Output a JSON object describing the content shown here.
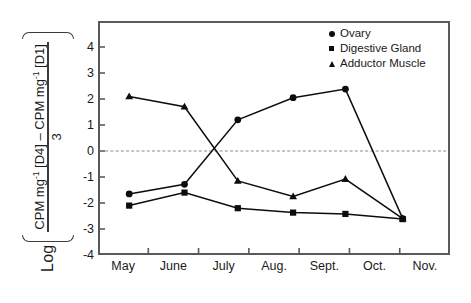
{
  "chart_data": {
    "type": "line",
    "title": "",
    "xlabel": "",
    "ylabel": "Log [ (CPM mg-1 [D4] - CPM mg-1 [D1]) / 3 ]",
    "ylabel_parts": {
      "log": "Log",
      "numerator_prefix": "CPM mg",
      "numerator_sup1": "-1",
      "numerator_mid": " [D4] – CPM mg",
      "numerator_sup2": "-1",
      "numerator_suffix": " [D1]",
      "denominator": "3"
    },
    "x_tick_labels": [
      "May",
      "June",
      "July",
      "Aug.",
      "Sept.",
      "Oct.",
      "Nov."
    ],
    "y_tick_labels": [
      "4",
      "3",
      "2",
      "1",
      "0",
      "-1",
      "-2",
      "-3",
      "-4"
    ],
    "ylim": [
      -4,
      5
    ],
    "xlim": [
      0,
      7
    ],
    "grid": false,
    "zero_reference_line": true,
    "legend_position": "top-right",
    "x": [
      0.62,
      1.72,
      2.78,
      3.88,
      4.92,
      6.06
    ],
    "series": [
      {
        "name": "Ovary",
        "marker": "circle",
        "color": "#0d0d0d",
        "values": [
          -1.65,
          -1.28,
          1.2,
          2.05,
          2.38,
          -2.6
        ]
      },
      {
        "name": "Digestive Gland",
        "marker": "square",
        "color": "#0d0d0d",
        "values": [
          -2.1,
          -1.6,
          -2.2,
          -2.37,
          -2.42,
          -2.62
        ]
      },
      {
        "name": "Adductor Muscle",
        "marker": "triangle",
        "color": "#0d0d0d",
        "values": [
          2.1,
          1.7,
          -1.15,
          -1.75,
          -1.08,
          -2.6
        ]
      }
    ]
  },
  "legend": {
    "items": [
      {
        "label": "Ovary",
        "marker": "circle"
      },
      {
        "label": "Digestive Gland",
        "marker": "square"
      },
      {
        "label": "Adductor Muscle",
        "marker": "triangle"
      }
    ]
  },
  "colors": {
    "series": "#0d0d0d",
    "axis": "#5a5a5a",
    "zero_line": "#8a8a8a",
    "text": "#1a1a1a",
    "background": "#ffffff"
  }
}
